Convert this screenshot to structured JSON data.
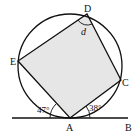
{
  "diagram": {
    "type": "circle-geometry",
    "points": {
      "A": {
        "label": "A"
      },
      "B": {
        "label": "B"
      },
      "C": {
        "label": "C"
      },
      "D": {
        "label": "D"
      },
      "E": {
        "label": "E"
      }
    },
    "angles": {
      "left_tangent_angle": "47°",
      "right_tangent_angle": "38°",
      "angle_at_D": "d"
    },
    "colors": {
      "fill": "#e6e6e6",
      "stroke": "#111111"
    }
  }
}
